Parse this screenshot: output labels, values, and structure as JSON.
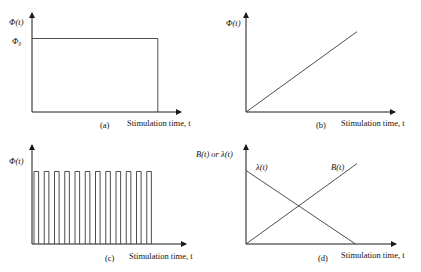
{
  "panels": [
    {
      "id": "a",
      "caption": "(a)",
      "xlabel": "Stimulation time, t",
      "ylabel": "Φ(t)",
      "level_label": "Φ₀",
      "kind": "constant",
      "description": "Constant stimulation Φ(t)=Φ₀ for a finite duration",
      "duration_fraction": 0.85,
      "level_fraction": 0.75
    },
    {
      "id": "b",
      "caption": "(b)",
      "xlabel": "Stimulation time, t",
      "ylabel": "Φ(t)",
      "kind": "ramp",
      "description": "Linearly increasing stimulation from zero",
      "end_x_fraction": 0.75,
      "end_y_fraction": 0.82
    },
    {
      "id": "c",
      "caption": "(c)",
      "xlabel": "Stimulation time, t",
      "ylabel": "Φ(t)",
      "kind": "pulse-train",
      "description": "Periodic rectangular pulse stimulation",
      "pulse_count": 12,
      "duty_cycle": 0.45,
      "level_fraction": 0.74
    },
    {
      "id": "d",
      "caption": "(d)",
      "xlabel": "Stimulation time, t",
      "ylabel": "B(t) or λ(t)",
      "kind": "crossing-lines",
      "description": "B(t) increases linearly while λ(t) decreases linearly",
      "series": [
        {
          "name": "λ(t)",
          "start": 0.75,
          "end": 0.0,
          "end_x_fraction": 0.74
        },
        {
          "name": "B(t)",
          "start": 0.0,
          "end": 0.82,
          "end_x_fraction": 0.75
        }
      ]
    }
  ]
}
